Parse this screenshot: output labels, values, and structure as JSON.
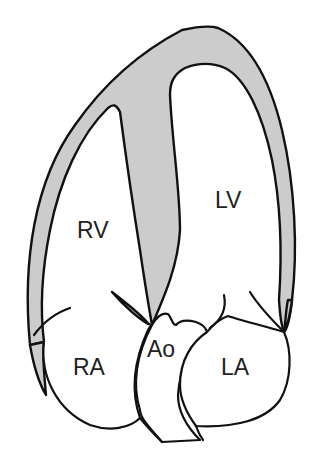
{
  "diagram": {
    "type": "cardiac-four-chamber-view",
    "colors": {
      "myocardium_fill": "#cccccc",
      "outline": "#111111",
      "background": "#ffffff",
      "label": "#222222"
    },
    "labels": {
      "rv": "RV",
      "lv": "LV",
      "ra": "RA",
      "la": "LA",
      "ao": "Ao"
    }
  }
}
